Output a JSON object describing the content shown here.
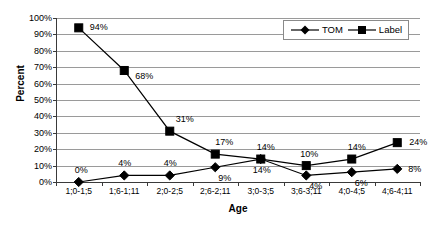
{
  "chart_data": {
    "type": "line",
    "title": "",
    "xlabel": "Age",
    "ylabel": "Percent",
    "ylim": [
      0,
      100
    ],
    "ytick_labels": [
      "100%",
      "90%",
      "80%",
      "70%",
      "60%",
      "50%",
      "40%",
      "30%",
      "20%",
      "10%",
      "0%"
    ],
    "ytick_values": [
      100,
      90,
      80,
      70,
      60,
      50,
      40,
      30,
      20,
      10,
      0
    ],
    "grid": true,
    "legend_position": "top-right",
    "categories": [
      "1;0-1;5",
      "1;6-1;11",
      "2;0-2;5",
      "2;6-2;11",
      "3;0-3;5",
      "3;6-3;11",
      "4;0-4;5",
      "4;6-4;11"
    ],
    "series": [
      {
        "name": "TOM",
        "marker": "diamond",
        "values": [
          0,
          4,
          4,
          9,
          14,
          4,
          6,
          8
        ],
        "point_labels": [
          "0%",
          "4%",
          "4%",
          "9%",
          "14%",
          "4%",
          "6%",
          "8%"
        ]
      },
      {
        "name": "Label",
        "marker": "square",
        "values": [
          94,
          68,
          31,
          17,
          14,
          10,
          14,
          24
        ],
        "point_labels": [
          "94%",
          "68%",
          "31%",
          "17%",
          "14%",
          "10%",
          "14%",
          "24%"
        ]
      }
    ],
    "colors": {
      "series_line": "#000000",
      "marker": "#000000",
      "gridline": "#9a9a9a",
      "axis": "#3a3a3a",
      "background": "#ffffff"
    }
  },
  "legend": {
    "entries": [
      {
        "label": "TOM"
      },
      {
        "label": "Label"
      }
    ]
  }
}
